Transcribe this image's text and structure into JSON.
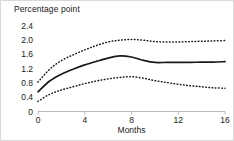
{
  "chart_data": {
    "type": "line",
    "title": "Percentage point",
    "xlabel": "Months",
    "ylabel": "Percentage point",
    "xlim": [
      0,
      16
    ],
    "ylim": [
      0,
      2.4
    ],
    "grid": false,
    "legend": "none",
    "xticks": [
      "0",
      "4",
      "8",
      "12",
      "16"
    ],
    "xtick_values": [
      0,
      4,
      8,
      12,
      16
    ],
    "yticks": [
      "0",
      "0.4",
      "0.8",
      "1.2",
      "1.6",
      "2.0",
      "2.4"
    ],
    "ytick_values": [
      0,
      0.4,
      0.8,
      1.2,
      1.6,
      2.0,
      2.4
    ],
    "x": [
      0,
      1,
      2,
      3,
      4,
      5,
      6,
      7,
      8,
      9,
      10,
      11,
      12,
      13,
      14,
      15,
      16
    ],
    "series": [
      {
        "name": "Upper confidence bound",
        "style": "dotted",
        "color": "#1a1a1a",
        "values": [
          0.82,
          1.18,
          1.42,
          1.58,
          1.72,
          1.84,
          1.94,
          1.99,
          2.01,
          1.99,
          1.95,
          1.94,
          1.94,
          1.95,
          1.96,
          1.97,
          1.98
        ]
      },
      {
        "name": "Point estimate",
        "style": "solid",
        "color": "#1a1a1a",
        "values": [
          0.55,
          0.85,
          1.04,
          1.18,
          1.3,
          1.4,
          1.49,
          1.55,
          1.52,
          1.43,
          1.37,
          1.37,
          1.37,
          1.37,
          1.38,
          1.38,
          1.39
        ]
      },
      {
        "name": "Lower confidence bound",
        "style": "dotted",
        "color": "#1a1a1a",
        "values": [
          0.28,
          0.48,
          0.6,
          0.69,
          0.78,
          0.85,
          0.91,
          0.95,
          0.97,
          0.93,
          0.86,
          0.81,
          0.76,
          0.72,
          0.69,
          0.66,
          0.65
        ]
      }
    ]
  }
}
